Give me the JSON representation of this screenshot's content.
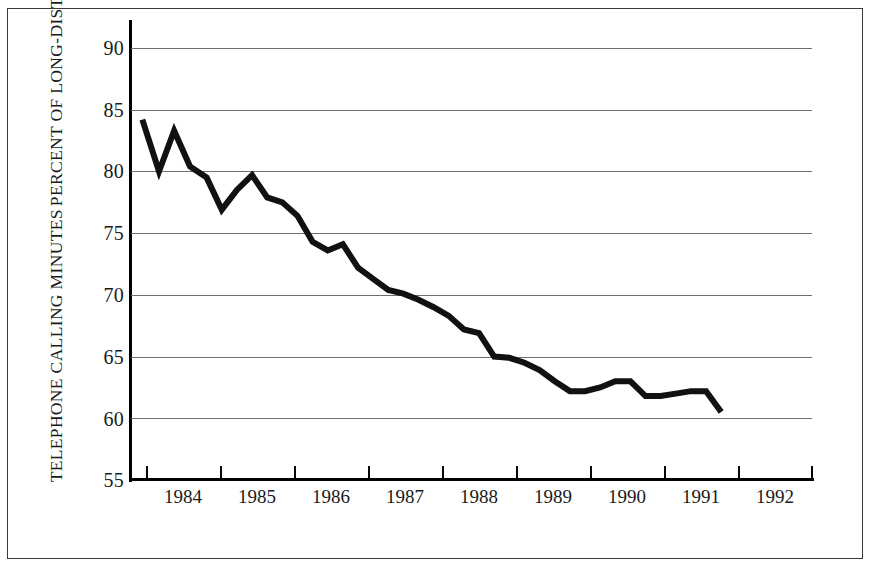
{
  "chart_data": {
    "type": "line",
    "title": "",
    "subtitle": "",
    "xlabel": "",
    "ylabel": "PERCENT OF LONG-DISTANCE TELEPHONE CALLING MINUTES",
    "ylabel_lines": [
      "PERCENT OF LONG-DISTANCE",
      "TELEPHONE CALLING MINUTES"
    ],
    "xlim": [
      1984.0,
      1993.0
    ],
    "ylim": [
      55,
      90
    ],
    "yticks": [
      55,
      60,
      65,
      70,
      75,
      80,
      85,
      90
    ],
    "ytick_labels": [
      "55",
      "60",
      "65",
      "70",
      "75",
      "80",
      "85",
      "90"
    ],
    "xticks": [
      1984,
      1985,
      1986,
      1987,
      1988,
      1989,
      1990,
      1991,
      1992,
      1993
    ],
    "xtick_labels": [
      "1984",
      "1985",
      "1986",
      "1987",
      "1988",
      "1989",
      "1990",
      "1991",
      "1992"
    ],
    "grid": "horizontal",
    "legend": "none",
    "line_color": "#111111",
    "line_width_px": 6,
    "frame_color": "#3a3a3a",
    "gridline_color": "#6f6f6f",
    "background_color": "#ffffff",
    "x": [
      1984.15,
      1984.37,
      1984.57,
      1984.78,
      1985.0,
      1985.2,
      1985.4,
      1985.6,
      1985.8,
      1986.0,
      1986.2,
      1986.4,
      1986.6,
      1986.8,
      1987.0,
      1987.2,
      1987.4,
      1987.6,
      1987.8,
      1988.0,
      1988.2,
      1988.4,
      1988.6,
      1988.8,
      1989.0,
      1989.2,
      1989.4,
      1989.6,
      1989.8,
      1990.0,
      1990.2,
      1990.4,
      1990.6,
      1990.8,
      1991.0,
      1991.2,
      1991.4,
      1991.6,
      1991.8
    ],
    "values": [
      84.2,
      80.0,
      83.3,
      80.4,
      79.5,
      76.9,
      78.5,
      79.7,
      77.9,
      77.5,
      76.4,
      74.3,
      73.6,
      74.1,
      72.2,
      71.3,
      70.4,
      70.1,
      69.6,
      69.0,
      68.3,
      67.2,
      66.9,
      65.0,
      64.9,
      64.5,
      63.9,
      63.0,
      62.2,
      62.2,
      62.5,
      63.0,
      63.0,
      61.8,
      61.8,
      62.0,
      62.2,
      62.2,
      60.5
    ],
    "series": [
      {
        "name": "Percent of long-distance telephone calling minutes",
        "values": [
          84.2,
          80.0,
          83.3,
          80.4,
          79.5,
          76.9,
          78.5,
          79.7,
          77.9,
          77.5,
          76.4,
          74.3,
          73.6,
          74.1,
          72.2,
          71.3,
          70.4,
          70.1,
          69.6,
          69.0,
          68.3,
          67.2,
          66.9,
          65.0,
          64.9,
          64.5,
          63.9,
          63.0,
          62.2,
          62.2,
          62.5,
          63.0,
          63.0,
          61.8,
          61.8,
          62.0,
          62.2,
          62.2,
          60.5
        ]
      }
    ]
  }
}
